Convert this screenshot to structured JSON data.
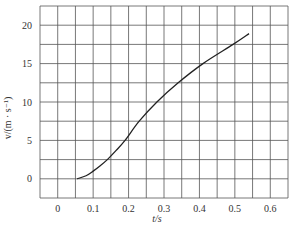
{
  "chart_data": {
    "type": "line",
    "title": "",
    "xlabel": "t/s",
    "ylabel": "v/(m · s⁻¹)",
    "xlim": [
      -0.05,
      0.65
    ],
    "ylim": [
      -2.5,
      22.5
    ],
    "x_ticks": [
      0,
      0.1,
      0.2,
      0.3,
      0.4,
      0.5,
      0.6
    ],
    "x_tick_labels": [
      "0",
      "0.1",
      "0.2",
      "0.3",
      "0.4",
      "0.5",
      "0.6"
    ],
    "y_ticks": [
      0,
      5,
      10,
      15,
      20
    ],
    "y_tick_labels": [
      "0",
      "5",
      "10",
      "15",
      "20"
    ],
    "x_grid_step": 0.05,
    "y_grid_step": 2.5,
    "grid": true,
    "legend": null,
    "series": [
      {
        "name": "v-t",
        "x": [
          0.055,
          0.08,
          0.1,
          0.12,
          0.14,
          0.165,
          0.19,
          0.23,
          0.28,
          0.34,
          0.41,
          0.495,
          0.54
        ],
        "y": [
          0.0,
          0.4,
          1.0,
          1.7,
          2.5,
          3.7,
          5.0,
          7.5,
          10.0,
          12.5,
          15.0,
          17.5,
          18.9
        ]
      }
    ]
  },
  "colors": {
    "grid": "#555555",
    "curve": "#222222",
    "text": "#333333"
  }
}
